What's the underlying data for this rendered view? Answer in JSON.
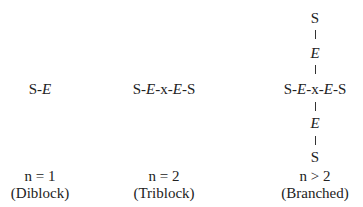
{
  "columns": [
    {
      "formula_parts": [
        "S-",
        "E"
      ],
      "n_label": "n = 1",
      "type_label": "(Diblock)"
    },
    {
      "formula_parts": [
        "S-",
        "E",
        "-x-",
        "E",
        "-S"
      ],
      "n_label": "n = 2",
      "type_label": "(Triblock)"
    },
    {
      "formula_parts": [
        "S-",
        "E",
        "-x-",
        "E",
        "-S"
      ],
      "top_arm": [
        "S",
        "E"
      ],
      "bottom_arm": [
        "E",
        "S"
      ],
      "n_label": "n > 2",
      "type_label": "(Branched)"
    }
  ]
}
